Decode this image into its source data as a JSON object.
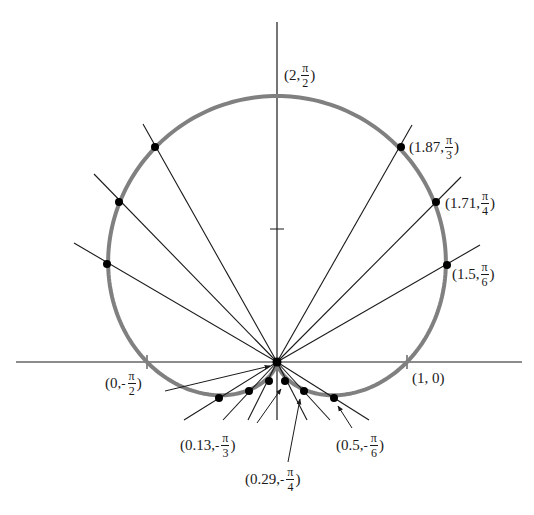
{
  "figure": {
    "curve": "r = 1 + sin(theta)",
    "curve_color": "#808080",
    "line_color": "#1a1a1a",
    "origin_px": [
      277,
      362
    ],
    "unit_px": [
      130,
      133
    ]
  },
  "axes": {
    "x_axis": {
      "from": [
        16,
        362
      ],
      "to": [
        522,
        362
      ],
      "ticks": [
        {
          "x": 147
        },
        {
          "x": 407
        }
      ]
    },
    "y_axis": {
      "from": [
        277,
        22
      ],
      "to": [
        277,
        420
      ],
      "ticks": [
        {
          "y": 229
        }
      ]
    }
  },
  "points": [
    {
      "r": "2",
      "theta_num": "π",
      "theta_den": "2",
      "sign": "",
      "dot": false,
      "px": [
        277,
        96
      ]
    },
    {
      "r": "1.87",
      "theta_num": "π",
      "theta_den": "3",
      "sign": "",
      "dot": true,
      "px": [
        401,
        147
      ]
    },
    {
      "r": "1.71",
      "theta_num": "π",
      "theta_den": "4",
      "sign": "",
      "dot": true,
      "px": [
        436,
        202
      ]
    },
    {
      "r": "1.5",
      "theta_num": "π",
      "theta_den": "6",
      "sign": "",
      "dot": true,
      "px": [
        447,
        265
      ]
    },
    {
      "r": "1",
      "theta": "0",
      "dot": false,
      "px": [
        407,
        362
      ]
    },
    {
      "r": "0.5",
      "theta_num": "π",
      "theta_den": "6",
      "sign": "-",
      "dot": true,
      "px": [
        334,
        398
      ]
    },
    {
      "r": "0.29",
      "theta_num": "π",
      "theta_den": "4",
      "sign": "-",
      "dot": true,
      "px": [
        304,
        391
      ]
    },
    {
      "r": "0.13",
      "theta_num": "π",
      "theta_den": "3",
      "sign": "-",
      "dot": true,
      "px": [
        285,
        381
      ]
    },
    {
      "r": "0",
      "theta_num": "π",
      "theta_den": "2",
      "sign": "-",
      "dot": false,
      "px": [
        277,
        362
      ]
    }
  ],
  "labels": {
    "top": {
      "open": "(2,",
      "num": "π",
      "den": "2",
      "close": ")"
    },
    "pi3": {
      "open": "(1.87,",
      "num": "π",
      "den": "3",
      "close": ")"
    },
    "pi4": {
      "open": "(1.71,",
      "num": "π",
      "den": "4",
      "close": ")"
    },
    "pi6": {
      "open": "(1.5,",
      "num": "π",
      "den": "6",
      "close": ")"
    },
    "one_zero": {
      "text": "(1, 0)"
    },
    "neg_pi2": {
      "open": "(0,",
      "sign": "-",
      "num": "π",
      "den": "2",
      "close": ")"
    },
    "neg_pi3": {
      "open": "(0.13,",
      "sign": "-",
      "num": "π",
      "den": "3",
      "close": ")"
    },
    "neg_pi4": {
      "open": "(0.29,",
      "sign": "-",
      "num": "π",
      "den": "4",
      "close": ")"
    },
    "neg_pi6": {
      "open": "(0.5,",
      "sign": "-",
      "num": "π",
      "den": "6",
      "close": ")"
    }
  }
}
